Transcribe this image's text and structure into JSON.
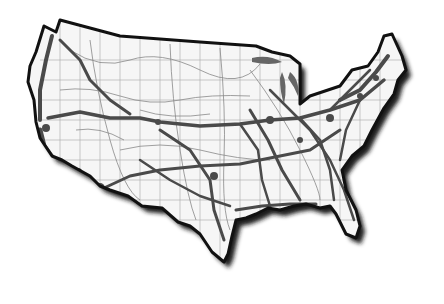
{
  "map": {
    "subject": "Contiguous United States transportation network density",
    "style": "grayscale",
    "colors": {
      "background": "#ffffff",
      "land": "#f4f4f4",
      "outline": "#111111",
      "shadow": "#222222",
      "major_corridor": "#4a4a4a",
      "minor_road": "#9a9a9a",
      "lakes": "#6a6a6a"
    }
  }
}
